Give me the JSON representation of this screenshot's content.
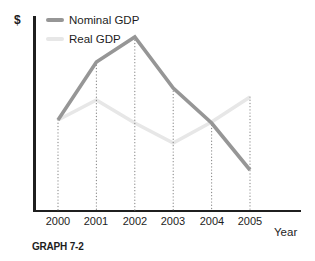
{
  "figure": {
    "y_axis_symbol": "$",
    "x_axis_title": "Year",
    "caption": "GRAPH 7-2"
  },
  "colors": {
    "axis": "#1f1f1f",
    "nominal_line": "#969696",
    "real_line": "#e7e7e7",
    "drop_line": "#8a8a8a",
    "text": "#1d1d1d",
    "background": "#ffffff"
  },
  "chart_data": {
    "type": "line",
    "categories": [
      "2000",
      "2001",
      "2002",
      "2003",
      "2004",
      "2005"
    ],
    "series": [
      {
        "name": "Nominal GDP",
        "color": "#969696",
        "values": [
          90,
          148,
          173,
          122,
          87,
          40
        ]
      },
      {
        "name": "Real GDP",
        "color": "#e7e7e7",
        "values": [
          90,
          110,
          87,
          67,
          88,
          113
        ]
      }
    ],
    "title": "",
    "xlabel": "Year",
    "ylabel": "$",
    "value_units": "relative height (y-axis unlabeled)",
    "ylim": [
      0,
      195
    ],
    "grid": "dotted vertical drop-lines from each data point to x-axis",
    "legend_position": "top-left"
  }
}
